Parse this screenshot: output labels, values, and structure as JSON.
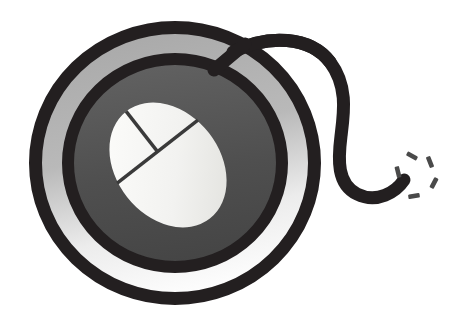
{
  "artwork": {
    "title": "Computer Mouse Target Logo",
    "kind": "logo-illustration",
    "subject": "computer-mouse",
    "background_color": "#ffffff",
    "canvas": {
      "width": 473,
      "height": 325
    }
  },
  "colors": {
    "ink": "#231f20",
    "outline": "#231f20",
    "ring_light_top": "#a9a9a9",
    "ring_light_bottom": "#ffffff",
    "disc_gray_top": "#5e5e5e",
    "disc_gray_bottom": "#474747",
    "mouse_body_light": "#f4f4f2",
    "mouse_body_shade": "#e2e2de",
    "button_divider": "#3a3a3a",
    "sparkle": "#4a4a4a",
    "background": "#ffffff"
  },
  "geometry": {
    "center_x": 175,
    "center_y": 163,
    "outer_ring_rx": 146,
    "outer_ring_ry": 142,
    "outer_ring_stroke": 13,
    "inner_ring_rx": 113,
    "inner_ring_ry": 110,
    "inner_ring_stroke": 12,
    "disc_rx": 104,
    "disc_ry": 101,
    "mouse_cx": 168,
    "mouse_cy": 165,
    "mouse_rx": 52,
    "mouse_ry": 68,
    "mouse_rotation_deg": -38
  },
  "parts": [
    {
      "id": "outer-ring",
      "label": "Outer target ring",
      "color": "#231f20"
    },
    {
      "id": "light-annulus",
      "label": "Light gradient ring band",
      "color": "#a9a9a9"
    },
    {
      "id": "inner-ring",
      "label": "Inner target ring",
      "color": "#231f20"
    },
    {
      "id": "gray-disc",
      "label": "Gray mouse pad disc",
      "color": "#545454"
    },
    {
      "id": "mouse-body",
      "label": "Mouse body ellipse",
      "color": "#f4f4f2"
    },
    {
      "id": "button-divider",
      "label": "Mouse button split lines",
      "color": "#3a3a3a"
    },
    {
      "id": "mouse-cable",
      "label": "Curled mouse cable",
      "color": "#231f20"
    },
    {
      "id": "click-sparkle",
      "label": "Click spark burst",
      "color": "#4a4a4a"
    }
  ],
  "sparkle": {
    "label": "click-burst",
    "count": 5,
    "dashes": [
      {
        "x": 412,
        "y": 156,
        "angle": -62,
        "w": 4.6,
        "h": 11.5
      },
      {
        "x": 430,
        "y": 162,
        "angle": -22,
        "w": 4.6,
        "h": 11.5
      },
      {
        "x": 398,
        "y": 172,
        "angle": -14,
        "w": 4.6,
        "h": 11.5
      },
      {
        "x": 434,
        "y": 183,
        "angle": 28,
        "w": 4.6,
        "h": 11.5
      },
      {
        "x": 414,
        "y": 196,
        "angle": 80,
        "w": 4.6,
        "h": 11.5
      }
    ]
  }
}
